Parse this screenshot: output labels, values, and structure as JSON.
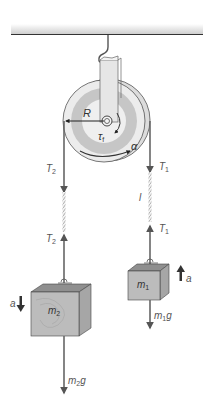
{
  "figure": {
    "colors": {
      "ceiling": "#333333",
      "ceiling_shade": "#d9d9d9",
      "pulley_outer": "#e9e9e9",
      "pulley_band": "#c7c7c7",
      "pulley_inner": "#efefef",
      "bracket": "#e2e2e2",
      "arrow": "#555555",
      "block_front": "#bdbdbd",
      "block_top": "#8f8f8f",
      "block_side": "#a5a5a5",
      "dark_arrow": "#444444"
    }
  },
  "labels": {
    "radius": {
      "main": "R",
      "sub": ""
    },
    "torque": {
      "main": "τ",
      "sub": "f"
    },
    "angular_accel": {
      "main": "α",
      "sub": ""
    },
    "tension_left_top": {
      "main": "T",
      "sub": "2"
    },
    "tension_left_bottom": {
      "main": "T",
      "sub": "2"
    },
    "tension_right_top": {
      "main": "T",
      "sub": "1"
    },
    "tension_right_bottom": {
      "main": "T",
      "sub": "1"
    },
    "rope_length": {
      "main": "l",
      "sub": ""
    },
    "mass_left": {
      "main": "m",
      "sub": "2"
    },
    "mass_right": {
      "main": "m",
      "sub": "1"
    },
    "accel_left": {
      "main": "a",
      "sub": ""
    },
    "accel_right": {
      "main": "a",
      "sub": ""
    },
    "weight_left": {
      "main": "m",
      "sub": "2",
      "tail": "g"
    },
    "weight_right": {
      "main": "m",
      "sub": "1",
      "tail": "g"
    }
  }
}
